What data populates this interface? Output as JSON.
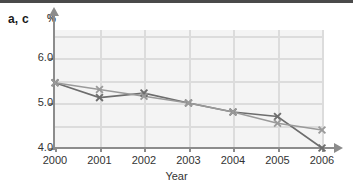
{
  "figure": {
    "panel_label": "a, c",
    "y_unit": "%"
  },
  "chart_data": {
    "type": "line",
    "title": "a, c",
    "xlabel": "Year",
    "ylabel": "%",
    "categories": [
      "2000",
      "2001",
      "2002",
      "2003",
      "2004",
      "2005",
      "2006"
    ],
    "x": [
      2000,
      2001,
      2002,
      2003,
      2004,
      2005,
      2006
    ],
    "xlim": [
      2000,
      2006
    ],
    "ylim": [
      4.0,
      6.5
    ],
    "y_ticks": [
      "6.0",
      "5.0",
      "4.0"
    ],
    "y_tick_values": [
      6.0,
      5.0,
      4.0
    ],
    "grid": true,
    "legend": "none",
    "marker": "x",
    "series": [
      {
        "name": "a",
        "color": "#6d6d6d",
        "values": [
          5.45,
          5.12,
          5.22,
          5.0,
          4.8,
          4.7,
          4.0
        ]
      },
      {
        "name": "c",
        "color": "#9a9a9a",
        "values": [
          5.45,
          5.3,
          5.15,
          5.0,
          4.8,
          4.55,
          4.4
        ]
      }
    ]
  },
  "axis": {
    "x_title": "Year",
    "x_tick_labels": [
      "2000",
      "2001",
      "2002",
      "2003",
      "2004",
      "2005",
      "2006"
    ],
    "y_tick_labels": [
      "6.0",
      "5.0",
      "4.0"
    ]
  },
  "colors": {
    "series_a": "#6d6d6d",
    "series_c": "#9a9a9a",
    "axis": "#8c8c8c",
    "grid": "#dcdcdc",
    "plot_bg": "#f4f4f4",
    "top_rule": "#4a4a4a"
  }
}
